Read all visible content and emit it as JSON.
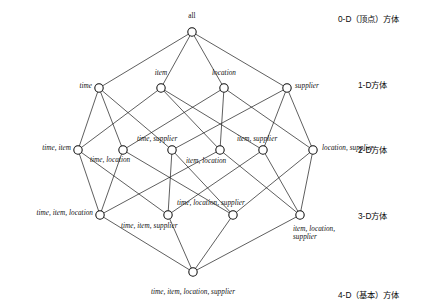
{
  "diagram": {
    "title": "all",
    "type": "cuboid-lattice",
    "nodes": [
      {
        "id": "all",
        "label": "all",
        "x": 192,
        "y": 32,
        "level": 0,
        "label_x": 192,
        "label_y": 12,
        "anchor": "center",
        "style": "plain"
      },
      {
        "id": "time",
        "label": "time",
        "x": 99,
        "y": 88,
        "level": 1,
        "label_x": 92,
        "label_y": 82,
        "anchor": "right",
        "style": "italic"
      },
      {
        "id": "item",
        "label": "item",
        "x": 161,
        "y": 88,
        "level": 1,
        "label_x": 161,
        "label_y": 69,
        "anchor": "center",
        "style": "italic"
      },
      {
        "id": "location",
        "label": "location",
        "x": 224,
        "y": 88,
        "level": 1,
        "label_x": 224,
        "label_y": 69,
        "anchor": "center",
        "style": "italic"
      },
      {
        "id": "supplier",
        "label": "supplier",
        "x": 287,
        "y": 88,
        "level": 1,
        "label_x": 295,
        "label_y": 82,
        "anchor": "left",
        "style": "italic"
      },
      {
        "id": "time_item",
        "label": "time, item",
        "x": 78,
        "y": 150,
        "level": 2,
        "label_x": 71,
        "label_y": 144,
        "anchor": "right",
        "style": "italic"
      },
      {
        "id": "time_location",
        "label": "time, location",
        "x": 123,
        "y": 150,
        "level": 2,
        "label_x": 90,
        "label_y": 156,
        "anchor": "left",
        "style": "italic"
      },
      {
        "id": "time_supplier",
        "label": "time, supplier",
        "x": 172,
        "y": 150,
        "level": 2,
        "label_x": 137,
        "label_y": 135,
        "anchor": "left",
        "style": "italic"
      },
      {
        "id": "item_location",
        "label": "item, location",
        "x": 220,
        "y": 150,
        "level": 2,
        "label_x": 186,
        "label_y": 157,
        "anchor": "left",
        "style": "italic"
      },
      {
        "id": "item_supplier",
        "label": "item, supplier",
        "x": 263,
        "y": 150,
        "level": 2,
        "label_x": 237,
        "label_y": 135,
        "anchor": "left",
        "style": "italic"
      },
      {
        "id": "location_supplier",
        "label": "location, supplier",
        "x": 313,
        "y": 150,
        "level": 2,
        "label_x": 322,
        "label_y": 144,
        "anchor": "left",
        "style": "italic-wrap"
      },
      {
        "id": "time_item_location",
        "label": "time, item, location",
        "x": 100,
        "y": 215,
        "level": 3,
        "label_x": 93,
        "label_y": 209,
        "anchor": "right",
        "style": "italic"
      },
      {
        "id": "time_item_supplier",
        "label": "time, item, supplier",
        "x": 168,
        "y": 215,
        "level": 3,
        "label_x": 121,
        "label_y": 222,
        "anchor": "left",
        "style": "italic"
      },
      {
        "id": "time_location_supplier",
        "label": "time, location, supplier",
        "x": 233,
        "y": 215,
        "level": 3,
        "label_x": 177,
        "label_y": 199,
        "anchor": "left",
        "style": "italic"
      },
      {
        "id": "item_location_supplier",
        "label": "item, location, supplier",
        "x": 300,
        "y": 215,
        "level": 3,
        "label_x": 293,
        "label_y": 225,
        "anchor": "left",
        "style": "italic-wrap"
      },
      {
        "id": "time_item_location_supplier",
        "label": "time, item, location, supplier",
        "x": 193,
        "y": 272,
        "level": 4,
        "label_x": 193,
        "label_y": 288,
        "anchor": "center",
        "style": "italic"
      }
    ],
    "edges": [
      [
        "all",
        "time"
      ],
      [
        "all",
        "item"
      ],
      [
        "all",
        "location"
      ],
      [
        "all",
        "supplier"
      ],
      [
        "time",
        "time_item"
      ],
      [
        "time",
        "time_location"
      ],
      [
        "time",
        "time_supplier"
      ],
      [
        "item",
        "time_item"
      ],
      [
        "item",
        "item_location"
      ],
      [
        "item",
        "item_supplier"
      ],
      [
        "location",
        "time_location"
      ],
      [
        "location",
        "item_location"
      ],
      [
        "location",
        "location_supplier"
      ],
      [
        "supplier",
        "time_supplier"
      ],
      [
        "supplier",
        "item_supplier"
      ],
      [
        "supplier",
        "location_supplier"
      ],
      [
        "time_item",
        "time_item_location"
      ],
      [
        "time_item",
        "time_item_supplier"
      ],
      [
        "time_location",
        "time_item_location"
      ],
      [
        "time_location",
        "time_location_supplier"
      ],
      [
        "time_supplier",
        "time_item_supplier"
      ],
      [
        "time_supplier",
        "time_location_supplier"
      ],
      [
        "item_location",
        "time_item_location"
      ],
      [
        "item_location",
        "item_location_supplier"
      ],
      [
        "item_supplier",
        "time_item_supplier"
      ],
      [
        "item_supplier",
        "item_location_supplier"
      ],
      [
        "location_supplier",
        "time_location_supplier"
      ],
      [
        "location_supplier",
        "item_location_supplier"
      ],
      [
        "time_item_location",
        "time_item_location_supplier"
      ],
      [
        "time_item_supplier",
        "time_item_location_supplier"
      ],
      [
        "time_location_supplier",
        "time_item_location_supplier"
      ],
      [
        "item_location_supplier",
        "time_item_location_supplier"
      ]
    ],
    "dimension_labels": [
      {
        "id": "dim-0",
        "text": "0-D（顶点）方体",
        "x": 338,
        "y": 12
      },
      {
        "id": "dim-1",
        "text": "1-D方体",
        "x": 358,
        "y": 78
      },
      {
        "id": "dim-2",
        "text": "2-D方体",
        "x": 358,
        "y": 143
      },
      {
        "id": "dim-3",
        "text": "3-D方体",
        "x": 358,
        "y": 209
      },
      {
        "id": "dim-4",
        "text": "4-D（基本）方体",
        "x": 338,
        "y": 288
      }
    ],
    "colors": {
      "edge": "#1a1a1a",
      "node_fill": "#ffffff",
      "node_stroke": "#0d0d0d",
      "text": "#111111",
      "background": "#ffffff"
    },
    "node_radius": 4.2
  }
}
